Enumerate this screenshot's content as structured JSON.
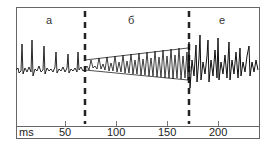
{
  "figure": {
    "segments": [
      {
        "id": "a",
        "label": "а",
        "x_ms_start": 0,
        "x_ms_end": 68
      },
      {
        "id": "b",
        "label": "б",
        "x_ms_start": 68,
        "x_ms_end": 170
      },
      {
        "id": "e",
        "label": "е",
        "x_ms_start": 170,
        "x_ms_end": 240
      }
    ],
    "axis": {
      "unit_label": "ms",
      "ticks": [
        "50",
        "100",
        "150",
        "200"
      ]
    },
    "boundaries_ms": [
      68,
      170
    ]
  }
}
